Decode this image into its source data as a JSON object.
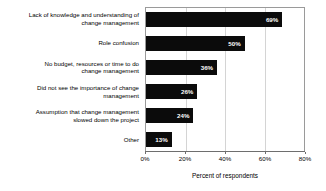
{
  "chart_data": {
    "type": "bar",
    "orientation": "horizontal",
    "title": "",
    "xlabel": "Percent of respondents",
    "ylabel": "",
    "xlim": [
      0,
      80
    ],
    "xtick_labels": [
      "0%",
      "20%",
      "40%",
      "60%",
      "80%"
    ],
    "xticks": [
      0,
      20,
      40,
      60,
      80
    ],
    "grid": true,
    "legend": "none",
    "categories": [
      "Lack of knowledge and understanding of change management",
      "Role confusion",
      "No budget, resources or time to do change management",
      "Did not see the importance of change management",
      "Assumption that change management slowed down the project",
      "Other"
    ],
    "values": [
      69,
      50,
      36,
      26,
      24,
      13
    ],
    "data_labels": [
      "69%",
      "50%",
      "36%",
      "26%",
      "24%",
      "13%"
    ],
    "bar_color": "#0b0b0b",
    "data_label_color": "#ffffff",
    "grid_color": "#d4d4d4",
    "axis_color": "#6e6e6e"
  },
  "category_lines": [
    [
      "Lack of knowledge and understanding of",
      "change management"
    ],
    [
      "Role confusion"
    ],
    [
      "No budget, resources or time to do",
      "change management"
    ],
    [
      "Did not see the importance of change",
      "management"
    ],
    [
      "Assumption that change management",
      "slowed down the project"
    ],
    [
      "Other"
    ]
  ]
}
